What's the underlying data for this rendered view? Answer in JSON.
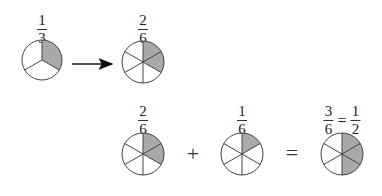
{
  "diagram": {
    "top_row": {
      "left": {
        "numerator": "1",
        "denominator": "3",
        "parts": 3,
        "shaded": 1
      },
      "right": {
        "numerator": "2",
        "denominator": "6",
        "parts": 6,
        "shaded": 2
      }
    },
    "bottom_row": {
      "first": {
        "numerator": "2",
        "denominator": "6",
        "parts": 6,
        "shaded": 2
      },
      "operator_plus": "+",
      "second": {
        "numerator": "1",
        "denominator": "6",
        "parts": 6,
        "shaded": 1
      },
      "operator_equals": "=",
      "result": {
        "numerator": "3",
        "denominator": "6",
        "equals": "=",
        "simplified_numerator": "1",
        "simplified_denominator": "2",
        "parts": 6,
        "shaded": 3
      }
    },
    "colors": {
      "shaded": "#a9a9a9",
      "outline": "#444444",
      "background": "#ffffff"
    }
  }
}
